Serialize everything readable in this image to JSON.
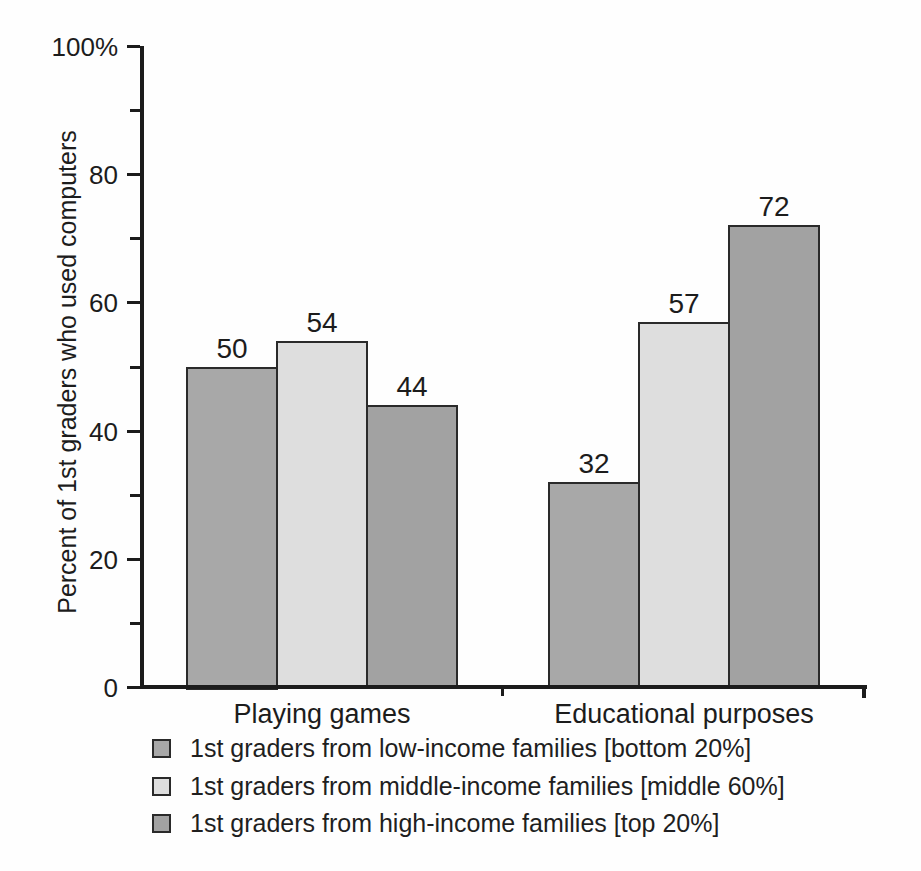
{
  "chart_data": {
    "type": "bar",
    "title": "",
    "ylabel": "Percent of 1st graders who used computers",
    "xlabel": "",
    "ylim": [
      0,
      100
    ],
    "grid": false,
    "legend_position": "bottom-left",
    "bar_value_labels": true,
    "y_major_tick_labels": [
      {
        "value": 0,
        "label": "0"
      },
      {
        "value": 20,
        "label": "20"
      },
      {
        "value": 40,
        "label": "40"
      },
      {
        "value": 60,
        "label": "60"
      },
      {
        "value": 80,
        "label": "80"
      },
      {
        "value": 100,
        "label": "100%"
      }
    ],
    "y_minor_ticks": [
      10,
      30,
      50,
      70,
      90
    ],
    "categories": [
      "Playing games",
      "Educational purposes"
    ],
    "series": [
      {
        "name": "1st graders from low-income families [bottom 20%]",
        "color": "#a8a8a8",
        "values": [
          50,
          32
        ]
      },
      {
        "name": "1st graders from middle-income families [middle 60%]",
        "color": "#dedede",
        "values": [
          54,
          57
        ]
      },
      {
        "name": "1st graders from high-income families [top 20%]",
        "color": "#a2a2a2",
        "values": [
          44,
          72
        ]
      }
    ],
    "colors": {
      "axis": "#1c1c1c",
      "bar_border": "#2a2a2a",
      "text": "#1f1f1f"
    }
  }
}
